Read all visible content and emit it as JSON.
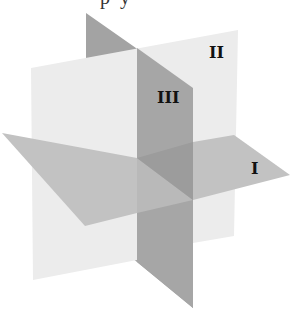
{
  "diagram": {
    "top_text_fragments": [
      "p",
      "y"
    ],
    "planes": [
      {
        "id": "I",
        "label": "I",
        "orientation": "horizontal",
        "color": "#c2c2c2"
      },
      {
        "id": "II",
        "label": "II",
        "orientation": "vertical-frontal",
        "color": "#ececec"
      },
      {
        "id": "III",
        "label": "III",
        "orientation": "vertical-profile",
        "color": "#a6a6a6"
      }
    ],
    "colors": {
      "plane_I": "#c2c2c2",
      "plane_II": "#ececec",
      "plane_III": "#a6a6a6",
      "label": "#111111",
      "background": "#ffffff"
    }
  }
}
